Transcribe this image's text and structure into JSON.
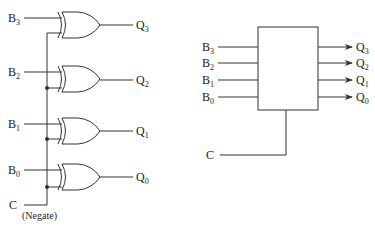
{
  "left_circuit": {
    "title": "XOR-based conditional negation circuit",
    "inputs": [
      {
        "base": "B",
        "sub": "3",
        "y": 18
      },
      {
        "base": "B",
        "sub": "2",
        "y": 72
      },
      {
        "base": "B",
        "sub": "1",
        "y": 124
      },
      {
        "base": "B",
        "sub": "0",
        "y": 170
      }
    ],
    "outputs": [
      {
        "base": "Q",
        "sub": "3"
      },
      {
        "base": "Q",
        "sub": "2"
      },
      {
        "base": "Q",
        "sub": "1"
      },
      {
        "base": "Q",
        "sub": "0"
      }
    ],
    "gate_type": "XOR",
    "control": {
      "label": "C",
      "note": "(Negate)"
    }
  },
  "right_block": {
    "title": "Block symbol",
    "inputs": [
      {
        "base": "B",
        "sub": "3"
      },
      {
        "base": "B",
        "sub": "2"
      },
      {
        "base": "B",
        "sub": "1"
      },
      {
        "base": "B",
        "sub": "0"
      }
    ],
    "outputs": [
      {
        "base": "Q",
        "sub": "3"
      },
      {
        "base": "Q",
        "sub": "2"
      },
      {
        "base": "Q",
        "sub": "1"
      },
      {
        "base": "Q",
        "sub": "0"
      }
    ],
    "control": {
      "label": "C"
    }
  }
}
